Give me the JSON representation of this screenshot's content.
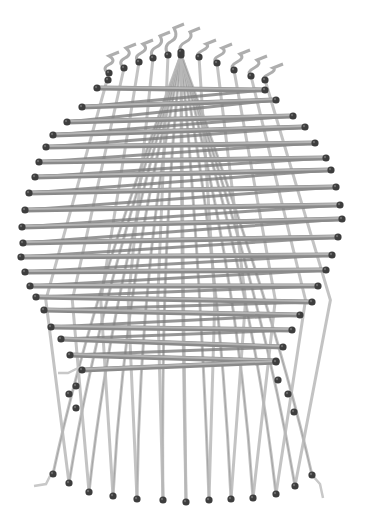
{
  "image": {
    "subject": "3D rendering of a woven basket-like structure",
    "width": 370,
    "height": 519,
    "background": "#ffffff",
    "colors": {
      "weft": "#8a8a8a",
      "warp": "#b9b9b9",
      "peg": "#3d3d3d"
    }
  },
  "apex": [
    181,
    55
  ],
  "top_warp_ends": [
    [
      109,
      73
    ],
    [
      124,
      68
    ],
    [
      139,
      62
    ],
    [
      153,
      58
    ],
    [
      168,
      55
    ],
    [
      181,
      52
    ],
    [
      199,
      57
    ],
    [
      217,
      63
    ],
    [
      234,
      70
    ],
    [
      251,
      76
    ],
    [
      265,
      80
    ]
  ],
  "top_tails": [
    [
      109,
      56
    ],
    [
      126,
      48
    ],
    [
      143,
      44
    ],
    [
      160,
      36
    ],
    [
      174,
      28
    ],
    [
      190,
      32
    ],
    [
      206,
      44
    ],
    [
      222,
      48
    ],
    [
      240,
      54
    ],
    [
      257,
      60
    ],
    [
      273,
      68
    ]
  ],
  "left_weft_ends": [
    [
      97,
      88
    ],
    [
      82,
      107
    ],
    [
      67,
      122
    ],
    [
      53,
      135
    ],
    [
      46,
      147
    ],
    [
      39,
      162
    ],
    [
      35,
      177
    ],
    [
      29,
      193
    ],
    [
      25,
      210
    ],
    [
      22,
      227
    ],
    [
      23,
      243
    ],
    [
      21,
      257
    ],
    [
      25,
      272
    ],
    [
      30,
      286
    ],
    [
      36,
      297
    ],
    [
      44,
      310
    ],
    [
      51,
      327
    ],
    [
      61,
      339
    ],
    [
      70,
      355
    ],
    [
      82,
      370
    ]
  ],
  "right_weft_ends": [
    [
      265,
      90
    ],
    [
      276,
      100
    ],
    [
      293,
      116
    ],
    [
      305,
      127
    ],
    [
      315,
      143
    ],
    [
      326,
      158
    ],
    [
      331,
      170
    ],
    [
      336,
      187
    ],
    [
      340,
      205
    ],
    [
      342,
      219
    ],
    [
      338,
      237
    ],
    [
      332,
      255
    ],
    [
      326,
      270
    ],
    [
      318,
      286
    ],
    [
      312,
      302
    ],
    [
      300,
      315
    ],
    [
      292,
      330
    ],
    [
      283,
      347
    ],
    [
      276,
      361
    ],
    [
      276,
      362
    ]
  ],
  "bottom_warp_ends": [
    [
      53,
      474
    ],
    [
      69,
      483
    ],
    [
      89,
      492
    ],
    [
      113,
      496
    ],
    [
      137,
      499
    ],
    [
      163,
      500
    ],
    [
      186,
      502
    ],
    [
      209,
      500
    ],
    [
      231,
      499
    ],
    [
      253,
      498
    ],
    [
      276,
      494
    ],
    [
      295,
      486
    ],
    [
      312,
      475
    ]
  ],
  "warp_top_anchor": [
    [
      90,
      180
    ],
    [
      100,
      170
    ],
    [
      112,
      160
    ],
    [
      125,
      150
    ],
    [
      140,
      140
    ],
    [
      160,
      130
    ],
    [
      181,
      125
    ],
    [
      200,
      130
    ],
    [
      220,
      140
    ],
    [
      238,
      150
    ],
    [
      252,
      160
    ],
    [
      262,
      170
    ],
    [
      272,
      180
    ]
  ],
  "loose_pegs": [
    [
      76,
      386
    ],
    [
      69,
      394
    ],
    [
      76,
      408
    ],
    [
      278,
      380
    ],
    [
      288,
      394
    ],
    [
      294,
      412
    ],
    [
      108,
      80
    ]
  ],
  "side_tails": {
    "left": [
      [
        58,
        373
      ],
      [
        68,
        373
      ],
      [
        80,
        367
      ]
    ],
    "bottom_left": [
      [
        34,
        486
      ],
      [
        46,
        484
      ],
      [
        50,
        476
      ]
    ],
    "bottom_right": [
      [
        312,
        475
      ],
      [
        320,
        484
      ],
      [
        323,
        498
      ]
    ]
  }
}
